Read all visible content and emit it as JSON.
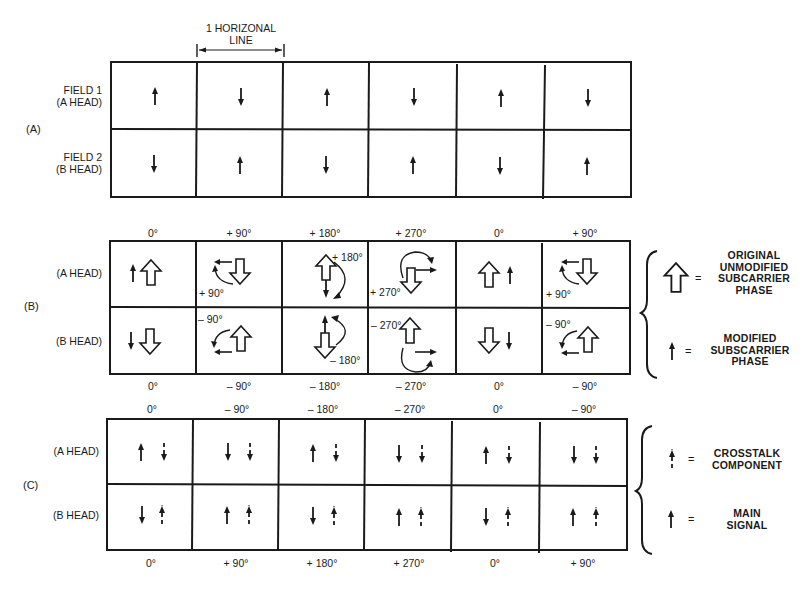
{
  "header": {
    "span_label_line1": "1 HORIZONAL",
    "span_label_line2": "LINE"
  },
  "section_a": {
    "label": "(A)",
    "rows": [
      {
        "label_line1": "FIELD 1",
        "label_line2": "(A HEAD)",
        "arrows": [
          "up",
          "down",
          "up",
          "down",
          "up",
          "down"
        ]
      },
      {
        "label_line1": "FIELD 2",
        "label_line2": "(B HEAD)",
        "arrows": [
          "down",
          "up",
          "down",
          "up",
          "down",
          "up"
        ]
      }
    ]
  },
  "section_b": {
    "label": "(B)",
    "top_degrees": [
      "0°",
      "+ 90°",
      "+ 180°",
      "+ 270°",
      "0°",
      "+ 90°"
    ],
    "bottom_degrees": [
      "0°",
      "– 90°",
      "– 180°",
      "– 270°",
      "0°",
      "– 90°"
    ],
    "rows": [
      {
        "label": "(A HEAD)",
        "cell_annotations": [
          "",
          "+ 90°",
          "+ 180°",
          "+ 270°",
          "",
          "+ 90°"
        ]
      },
      {
        "label": "(B HEAD)",
        "cell_annotations": [
          "",
          "– 90°",
          "– 180°",
          "– 270°",
          "",
          "– 90°"
        ]
      }
    ],
    "legend": [
      {
        "symbol": "hollow-arrow-up",
        "equals": "=",
        "lines": [
          "ORIGINAL",
          "UNMODIFIED",
          "SUBCARRIER",
          "PHASE"
        ]
      },
      {
        "symbol": "solid-arrow-up",
        "equals": "=",
        "lines": [
          "MODIFIED",
          "SUBSCARRIER",
          "PHASE"
        ]
      }
    ]
  },
  "section_c": {
    "label": "(C)",
    "top_degrees": [
      "0°",
      "– 90°",
      "– 180°",
      "– 270°",
      "0°",
      "– 90°"
    ],
    "bottom_degrees": [
      "0°",
      "+ 90°",
      "+ 180°",
      "+ 270°",
      "0°",
      "+ 90°"
    ],
    "rows": [
      {
        "label": "(A HEAD)",
        "main": [
          "up",
          "down",
          "up",
          "down",
          "up",
          "down"
        ],
        "crosstalk": [
          "down",
          "down",
          "down",
          "down",
          "down",
          "down"
        ]
      },
      {
        "label": "(B HEAD)",
        "main": [
          "down",
          "up",
          "down",
          "up",
          "down",
          "up"
        ],
        "crosstalk": [
          "up",
          "up",
          "up",
          "up",
          "up",
          "up"
        ]
      }
    ],
    "legend": [
      {
        "symbol": "dashed-arrow-up",
        "equals": "=",
        "lines": [
          "CROSSTALK",
          "COMPONENT"
        ]
      },
      {
        "symbol": "solid-arrow-up",
        "equals": "=",
        "lines": [
          "MAIN",
          "SIGNAL"
        ]
      }
    ]
  }
}
